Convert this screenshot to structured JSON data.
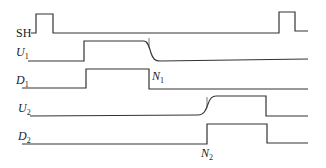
{
  "diagram": {
    "type": "timing-diagram",
    "signals": [
      {
        "id": "SH",
        "label": "SH",
        "subscript": ""
      },
      {
        "id": "U1",
        "label": "U",
        "subscript": "1"
      },
      {
        "id": "D1",
        "label": "D",
        "subscript": "1"
      },
      {
        "id": "U2",
        "label": "U",
        "subscript": "2"
      },
      {
        "id": "D2",
        "label": "D",
        "subscript": "2"
      }
    ],
    "markers": [
      {
        "id": "N1",
        "label": "N",
        "subscript": "1"
      },
      {
        "id": "N2",
        "label": "N",
        "subscript": "2"
      }
    ],
    "colors": {
      "stroke": "#333333",
      "background": "#ffffff"
    }
  }
}
